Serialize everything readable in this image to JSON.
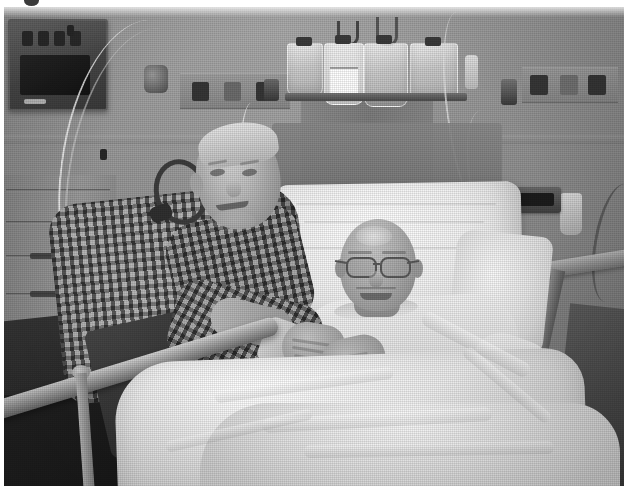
{
  "page": {
    "background_color": "#ffffff",
    "width": 628,
    "height": 496,
    "artifact_label": "clipped-bullet-mark"
  },
  "photo": {
    "caption": "",
    "alt_text": "Black-and-white halftone photograph of a hospital room: an older man in a checkered shirt leans over a hospital bed beside a smiling bald patient wearing glasses.",
    "medium": "halftone print",
    "color_mode": "grayscale",
    "frame": {
      "x": 4,
      "y": 7,
      "width": 620,
      "height": 479
    },
    "tones": {
      "wall": "#9a9a9a",
      "linens": "#efefef",
      "shadow": "#2a2a2a",
      "skin": "#b4b4b4",
      "equipment_dark": "#3a3a3a"
    }
  },
  "scene": {
    "setting": "hospital patient room",
    "subjects": [
      {
        "id": "visitor",
        "role": "visitor",
        "description": "older man with short light hair, checkered plaid shirt, leaning over the bed rail, smiling",
        "clothing": "checkered plaid button shirt",
        "pose": "leaning forward, arm resting on bed rail"
      },
      {
        "id": "patient",
        "role": "patient",
        "description": "bald patient wearing eyeglasses, smiling, reclined against a large white pillow",
        "clothing": "light hospital gown",
        "pose": "reclined in bed"
      }
    ],
    "objects": [
      {
        "id": "hospital-bed",
        "label": "hospital bed"
      },
      {
        "id": "bed-rail-left",
        "label": "left bed rail"
      },
      {
        "id": "bed-rail-right",
        "label": "right bed rail"
      },
      {
        "id": "pillow",
        "label": "white pillow"
      },
      {
        "id": "blanket",
        "label": "white blanket and sheets"
      },
      {
        "id": "iv-pole",
        "label": "IV pole with hanging fluid bags"
      },
      {
        "id": "iv-bags",
        "label": "four IV fluid bags"
      },
      {
        "id": "iv-tubing",
        "label": "IV tubing lines"
      },
      {
        "id": "patient-monitor",
        "label": "patient monitor unit"
      },
      {
        "id": "supply-cabinet",
        "label": "supply cabinet with drawers"
      },
      {
        "id": "medical-gas-panel",
        "label": "wall medical gas panel"
      },
      {
        "id": "wall-outlet-panel",
        "label": "wall outlet panel"
      },
      {
        "id": "wall-device",
        "label": "small wall-mounted device"
      }
    ]
  }
}
